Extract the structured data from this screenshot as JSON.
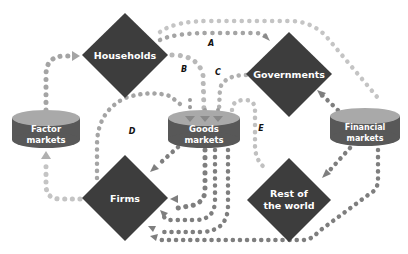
{
  "diagram": {
    "colors": {
      "diamond": "#3d3d3d",
      "cylinder_side": "#585858",
      "cylinder_top": "#a9a9a9",
      "dots_light": "#c4c4c4",
      "dots_mid": "#a4a4a4",
      "dots_dark": "#7e7e7e",
      "label_text": "#ffffff",
      "flow_label": "#111111"
    },
    "sectors": [
      {
        "id": "households",
        "label": "Households",
        "shape": "diamond"
      },
      {
        "id": "governments",
        "label": "Governments",
        "shape": "diamond"
      },
      {
        "id": "firms",
        "label": "Firms",
        "shape": "diamond"
      },
      {
        "id": "rest_of_world",
        "label_line1": "Rest of",
        "label_line2": "the world",
        "shape": "diamond"
      }
    ],
    "markets": [
      {
        "id": "factor_markets",
        "label_line1": "Factor",
        "label_line2": "markets",
        "shape": "cylinder"
      },
      {
        "id": "goods_markets",
        "label_line1": "Goods",
        "label_line2": "markets",
        "shape": "cylinder"
      },
      {
        "id": "financial_markets",
        "label_line1": "Financial",
        "label_line2": "markets",
        "shape": "cylinder"
      }
    ],
    "flow_labels": {
      "A": "A",
      "B": "B",
      "C": "C",
      "D": "D",
      "E": "E"
    }
  }
}
